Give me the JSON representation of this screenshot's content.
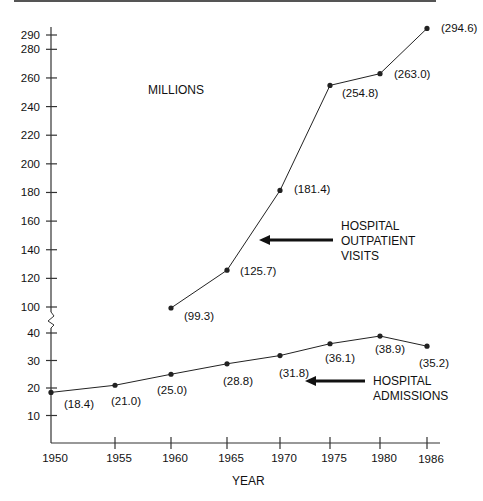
{
  "chart_data": {
    "type": "line",
    "title": "",
    "unit_label": "MILLIONS",
    "xlabel": "YEAR",
    "ylabel": "MILLIONS",
    "x": [
      1950,
      1955,
      1960,
      1965,
      1970,
      1975,
      1980,
      1986
    ],
    "x_tick_labels": [
      "1950",
      "1955",
      "1960",
      "1965",
      "1970",
      "1975",
      "1980",
      "1986"
    ],
    "y_tick_labels": [
      "10",
      "20",
      "30",
      "40",
      "100",
      "120",
      "140",
      "160",
      "180",
      "200",
      "220",
      "240",
      "260",
      "280",
      "290"
    ],
    "y_axis_break": "between 40 and 100",
    "grid": false,
    "series": [
      {
        "name": "HOSPITAL OUTPATIENT VISITS",
        "label_lines": [
          "HOSPITAL",
          "OUTPATIENT",
          "VISITS"
        ],
        "x": [
          1960,
          1965,
          1970,
          1975,
          1980,
          1986
        ],
        "values": [
          99.3,
          125.7,
          181.4,
          254.8,
          263.0,
          294.6
        ],
        "value_labels": [
          "(99.3)",
          "(125.7)",
          "(181.4)",
          "(254.8)",
          "(263.0)",
          "(294.6)"
        ]
      },
      {
        "name": "HOSPITAL ADMISSIONS",
        "label_lines": [
          "HOSPITAL",
          "ADMISSIONS"
        ],
        "x": [
          1950,
          1955,
          1960,
          1965,
          1970,
          1975,
          1980,
          1986
        ],
        "values": [
          18.4,
          21.0,
          25.0,
          28.8,
          31.8,
          36.1,
          38.9,
          35.2
        ],
        "value_labels": [
          "(18.4)",
          "(21.0)",
          "(25.0)",
          "(28.8)",
          "(31.8)",
          "(36.1)",
          "(38.9)",
          "(35.2)"
        ]
      }
    ],
    "colors": {
      "line": "#222222",
      "axis": "#333333",
      "text": "#111111"
    }
  }
}
